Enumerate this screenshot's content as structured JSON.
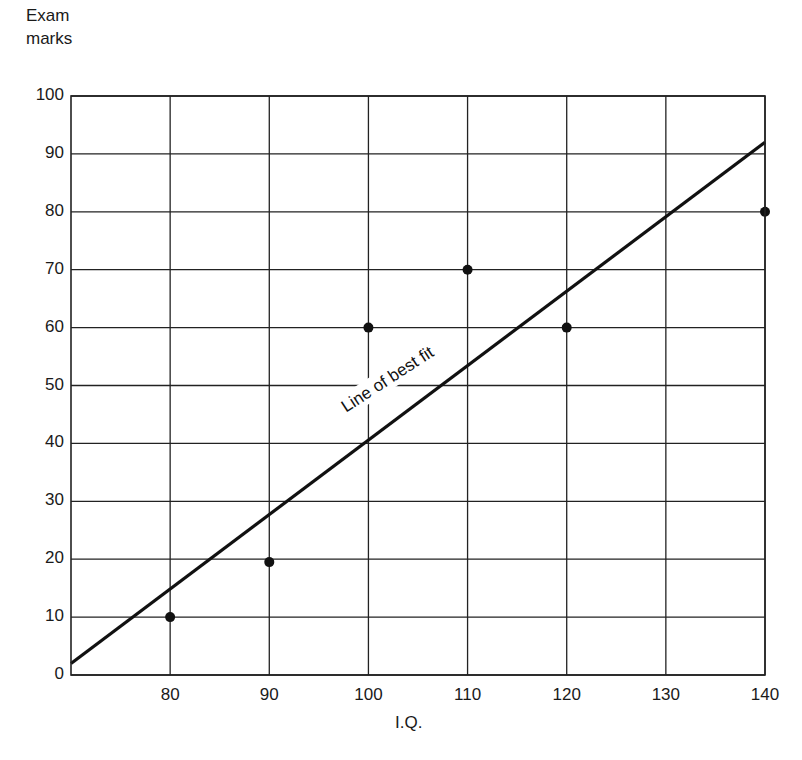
{
  "chart_data": {
    "type": "scatter",
    "title": "",
    "xlabel": "I.Q.",
    "ylabel": "Exam marks",
    "xlim": [
      70,
      140
    ],
    "ylim": [
      0,
      100
    ],
    "grid": true,
    "x_ticks": [
      80,
      90,
      100,
      110,
      120,
      130,
      140
    ],
    "y_ticks": [
      0,
      10,
      20,
      30,
      40,
      50,
      60,
      70,
      80,
      90,
      100
    ],
    "series": [
      {
        "name": "Data points",
        "type": "scatter",
        "points": [
          {
            "x": 80,
            "y": 10
          },
          {
            "x": 90,
            "y": 19.5
          },
          {
            "x": 100,
            "y": 60
          },
          {
            "x": 110,
            "y": 70
          },
          {
            "x": 120,
            "y": 60
          },
          {
            "x": 140,
            "y": 80
          }
        ]
      },
      {
        "name": "Line of best fit",
        "type": "line",
        "points": [
          {
            "x": 70,
            "y": 2
          },
          {
            "x": 140,
            "y": 92
          }
        ]
      }
    ],
    "annotations": [
      {
        "text": "Line of best fit",
        "x": 104,
        "y": 47,
        "rotation_deg": -33
      }
    ]
  },
  "labels": {
    "y_axis_title_line1": "Exam",
    "y_axis_title_line2": "marks",
    "x_axis_title": "I.Q.",
    "annotation": "Line of best fit"
  }
}
